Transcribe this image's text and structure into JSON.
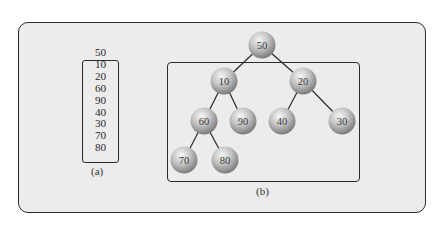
{
  "figure": {
    "panel_a": {
      "caption": "(a)",
      "sequence": [
        "50",
        "10",
        "20",
        "60",
        "90",
        "40",
        "30",
        "70",
        "80"
      ],
      "boxed_from_index": 1
    },
    "panel_b": {
      "caption": "(b)",
      "tree": {
        "root": "50",
        "nodes": [
          {
            "id": "n50",
            "label": "50",
            "cx": 262,
            "cy": 45
          },
          {
            "id": "n10",
            "label": "10",
            "cx": 224,
            "cy": 81
          },
          {
            "id": "n20",
            "label": "20",
            "cx": 303,
            "cy": 81
          },
          {
            "id": "n60",
            "label": "60",
            "cx": 204,
            "cy": 121
          },
          {
            "id": "n90",
            "label": "90",
            "cx": 243,
            "cy": 121
          },
          {
            "id": "n40",
            "label": "40",
            "cx": 282,
            "cy": 121
          },
          {
            "id": "n30",
            "label": "30",
            "cx": 342,
            "cy": 121
          },
          {
            "id": "n70",
            "label": "70",
            "cx": 184,
            "cy": 160
          },
          {
            "id": "n80",
            "label": "80",
            "cx": 225,
            "cy": 160
          }
        ],
        "edges": [
          [
            "n50",
            "n10"
          ],
          [
            "n50",
            "n20"
          ],
          [
            "n10",
            "n60"
          ],
          [
            "n10",
            "n90"
          ],
          [
            "n20",
            "n40"
          ],
          [
            "n20",
            "n30"
          ],
          [
            "n60",
            "n70"
          ],
          [
            "n60",
            "n80"
          ]
        ],
        "boxed_subtrees": [
          "n10",
          "n20"
        ]
      }
    },
    "colors": {
      "panel_bg": "#ececec",
      "border": "#2b2b2b",
      "node_light": "#f2f2f2",
      "node_dark": "#7a7a7a"
    }
  }
}
